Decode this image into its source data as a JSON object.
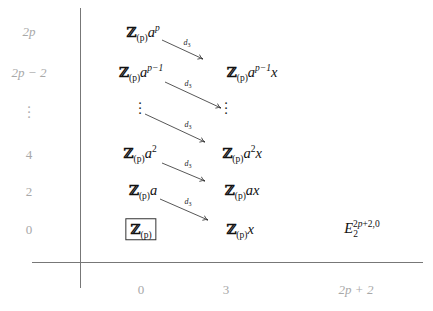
{
  "diagram": {
    "type": "spectral-sequence-page",
    "page": "E3",
    "y_axis": {
      "labels": [
        "2p",
        "2p − 2",
        "⋮",
        "4",
        "2",
        "0"
      ]
    },
    "x_axis": {
      "labels": [
        "0",
        "3",
        "2p + 2"
      ]
    },
    "entries": {
      "col0": [
        {
          "row": "2p",
          "base": "Z",
          "sub": "(p)",
          "tail": "a",
          "sup": "p",
          "suffix": ""
        },
        {
          "row": "2p-2",
          "base": "Z",
          "sub": "(p)",
          "tail": "a",
          "sup": "p−1",
          "suffix": ""
        },
        {
          "row": "4",
          "base": "Z",
          "sub": "(p)",
          "tail": "a",
          "sup": "2",
          "suffix": ""
        },
        {
          "row": "2",
          "base": "Z",
          "sub": "(p)",
          "tail": "a",
          "sup": "",
          "suffix": ""
        },
        {
          "row": "0",
          "base": "Z",
          "sub": "(p)",
          "tail": "",
          "sup": "",
          "suffix": "",
          "boxed": true
        }
      ],
      "col3": [
        {
          "row": "2p-2",
          "base": "Z",
          "sub": "(p)",
          "tail": "a",
          "sup": "p−1",
          "suffix": "x"
        },
        {
          "row": "4",
          "base": "Z",
          "sub": "(p)",
          "tail": "a",
          "sup": "2",
          "suffix": "x"
        },
        {
          "row": "2",
          "base": "Z",
          "sub": "(p)",
          "tail": "a",
          "sup": "",
          "suffix": "x"
        },
        {
          "row": "0",
          "base": "Z",
          "sub": "(p)",
          "tail": "",
          "sup": "",
          "suffix": "x"
        }
      ],
      "col_2p2": {
        "row": "0",
        "base": "E",
        "sub": "2",
        "sup": "2p+2,0"
      }
    },
    "differentials": {
      "label_base": "d",
      "label_sub": "3",
      "count": 5
    },
    "vdots": "⋮"
  }
}
